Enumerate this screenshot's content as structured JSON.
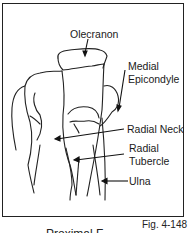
{
  "figure": {
    "number": "Fig. 4-148",
    "caption_partial": "Proximal F",
    "labels": {
      "olecranon": "Olecranon",
      "medial_epicondyle_1": "Medial",
      "medial_epicondyle_2": "Epicondyle",
      "radial_neck": "Radial Neck",
      "radial_tubercle_1": "Radial",
      "radial_tubercle_2": "Tubercle",
      "ulna": "Ulna"
    }
  }
}
